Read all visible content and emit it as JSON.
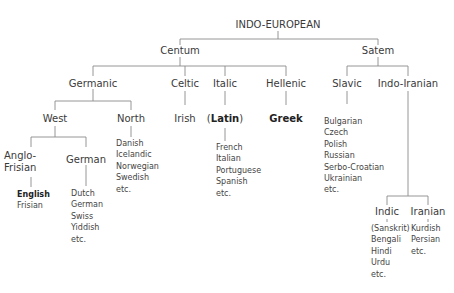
{
  "root": "INDO-EUROPEAN",
  "branches": {
    "centum": "Centum",
    "satem": "Satem"
  },
  "centum_children": {
    "germanic": "Germanic",
    "celtic": "Celtic",
    "italic": "Italic",
    "hellenic": "Hellenic"
  },
  "germanic_children": {
    "west": "West",
    "north": "North"
  },
  "west_children": {
    "anglo_frisian_line1": "Anglo-",
    "anglo_frisian_line2": "Frisian",
    "german": "German"
  },
  "anglo_frisian_languages": [
    "English",
    "Frisian"
  ],
  "german_languages": [
    "Dutch",
    "German",
    "Swiss",
    "Yiddish",
    "etc."
  ],
  "north_languages": [
    "Danish",
    "Icelandic",
    "Norwegian",
    "Swedish",
    "etc."
  ],
  "celtic_languages": [
    "Irish"
  ],
  "italic_parent": {
    "open": "(",
    "name": "Latin",
    "close": ")"
  },
  "italic_languages": [
    "French",
    "Italian",
    "Portuguese",
    "Spanish",
    "etc."
  ],
  "hellenic_languages": [
    "Greek"
  ],
  "satem_children": {
    "slavic": "Slavic",
    "indo_iranian": "Indo-Iranian"
  },
  "slavic_languages": [
    "Bulgarian",
    "Czech",
    "Polish",
    "Russian",
    "Serbo-Croatian",
    "Ukrainian",
    "etc."
  ],
  "indo_iranian_children": {
    "indic": "Indic",
    "iranian": "Iranian"
  },
  "indic_languages": [
    "(Sanskrit)",
    "Bengali",
    "Hindi",
    "Urdu",
    "etc."
  ],
  "iranian_languages": [
    "Kurdish",
    "Persian",
    "etc."
  ]
}
